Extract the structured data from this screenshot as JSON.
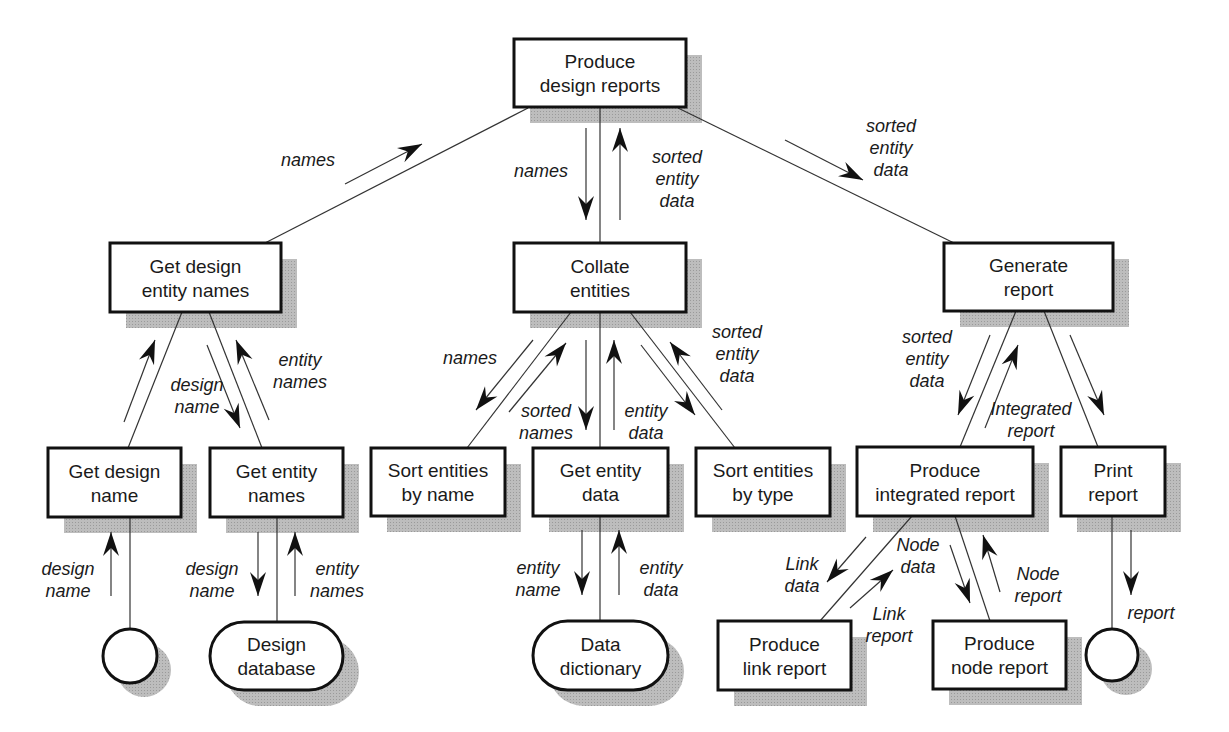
{
  "diagram": {
    "colors": {
      "box_border": "#111111",
      "shadow": "#b4b4b4",
      "line": "#333333",
      "background": "#ffffff"
    },
    "shadow_offset": 16,
    "nodes": [
      {
        "id": "produce-design-reports",
        "shape": "rect",
        "x": 514,
        "y": 39,
        "w": 172,
        "h": 68,
        "lines": [
          "Produce",
          "design reports"
        ]
      },
      {
        "id": "get-design-entity-names",
        "shape": "rect",
        "x": 110,
        "y": 243,
        "w": 171,
        "h": 69,
        "lines": [
          "Get design",
          "entity names"
        ]
      },
      {
        "id": "collate-entities",
        "shape": "rect",
        "x": 514,
        "y": 243,
        "w": 172,
        "h": 69,
        "lines": [
          "Collate",
          "entities"
        ]
      },
      {
        "id": "generate-report",
        "shape": "rect",
        "x": 944,
        "y": 243,
        "w": 169,
        "h": 68,
        "lines": [
          "Generate",
          "report"
        ]
      },
      {
        "id": "get-design-name",
        "shape": "rect",
        "x": 48,
        "y": 448,
        "w": 133,
        "h": 69,
        "lines": [
          "Get design",
          "name"
        ]
      },
      {
        "id": "get-entity-names",
        "shape": "rect",
        "x": 210,
        "y": 448,
        "w": 133,
        "h": 69,
        "lines": [
          "Get entity",
          "names"
        ]
      },
      {
        "id": "sort-entities-by-name",
        "shape": "rect",
        "x": 371,
        "y": 448,
        "w": 134,
        "h": 68,
        "lines": [
          "Sort entities",
          "by name"
        ]
      },
      {
        "id": "get-entity-data",
        "shape": "rect",
        "x": 533,
        "y": 448,
        "w": 135,
        "h": 68,
        "lines": [
          "Get entity",
          "data"
        ]
      },
      {
        "id": "sort-entities-by-type",
        "shape": "rect",
        "x": 696,
        "y": 448,
        "w": 134,
        "h": 68,
        "lines": [
          "Sort entities",
          "by type"
        ]
      },
      {
        "id": "produce-integrated-report",
        "shape": "rect",
        "x": 857,
        "y": 447,
        "w": 176,
        "h": 69,
        "lines": [
          "Produce",
          "integrated report"
        ]
      },
      {
        "id": "print-report",
        "shape": "rect",
        "x": 1061,
        "y": 447,
        "w": 104,
        "h": 69,
        "lines": [
          "Print",
          "report"
        ]
      },
      {
        "id": "produce-link-report",
        "shape": "rect",
        "x": 718,
        "y": 621,
        "w": 133,
        "h": 69,
        "lines": [
          "Produce",
          "link report"
        ]
      },
      {
        "id": "produce-node-report",
        "shape": "rect",
        "x": 933,
        "y": 621,
        "w": 133,
        "h": 68,
        "lines": [
          "Produce",
          "node report"
        ]
      },
      {
        "id": "design-database",
        "shape": "rounded",
        "x": 210,
        "y": 622,
        "w": 133,
        "h": 68,
        "lines": [
          "Design",
          "database"
        ]
      },
      {
        "id": "data-dictionary",
        "shape": "rounded",
        "x": 533,
        "y": 621,
        "w": 135,
        "h": 69,
        "lines": [
          "Data",
          "dictionary"
        ]
      },
      {
        "id": "terminator-left",
        "shape": "circle",
        "cx": 130,
        "cy": 656,
        "r": 27,
        "lines": []
      },
      {
        "id": "terminator-right",
        "shape": "circle",
        "cx": 1112,
        "cy": 655,
        "r": 26,
        "lines": []
      }
    ],
    "connectors": [
      {
        "from": "produce-design-reports",
        "to": "get-design-entity-names",
        "x1": 528,
        "y1": 108,
        "x2": 265,
        "y2": 243
      },
      {
        "from": "produce-design-reports",
        "to": "collate-entities",
        "x1": 600,
        "y1": 108,
        "x2": 600,
        "y2": 243
      },
      {
        "from": "produce-design-reports",
        "to": "generate-report",
        "x1": 678,
        "y1": 108,
        "x2": 954,
        "y2": 243
      },
      {
        "from": "get-design-entity-names",
        "to": "get-design-name",
        "x1": 182,
        "y1": 312,
        "x2": 128,
        "y2": 448
      },
      {
        "from": "get-design-entity-names",
        "to": "get-entity-names",
        "x1": 209,
        "y1": 312,
        "x2": 262,
        "y2": 448
      },
      {
        "from": "get-design-name",
        "to": "terminator-left",
        "x1": 130,
        "y1": 517,
        "x2": 130,
        "y2": 629
      },
      {
        "from": "get-entity-names",
        "to": "design-database",
        "x1": 277,
        "y1": 517,
        "x2": 277,
        "y2": 622
      },
      {
        "from": "collate-entities",
        "to": "sort-entities-by-name",
        "x1": 571,
        "y1": 312,
        "x2": 467,
        "y2": 448
      },
      {
        "from": "collate-entities",
        "to": "get-entity-data",
        "x1": 600,
        "y1": 312,
        "x2": 600,
        "y2": 448
      },
      {
        "from": "collate-entities",
        "to": "sort-entities-by-type",
        "x1": 630,
        "y1": 312,
        "x2": 735,
        "y2": 448
      },
      {
        "from": "get-entity-data",
        "to": "data-dictionary",
        "x1": 600,
        "y1": 516,
        "x2": 600,
        "y2": 621
      },
      {
        "from": "generate-report",
        "to": "produce-integrated-report",
        "x1": 1016,
        "y1": 311,
        "x2": 960,
        "y2": 447
      },
      {
        "from": "generate-report",
        "to": "print-report",
        "x1": 1044,
        "y1": 311,
        "x2": 1098,
        "y2": 447
      },
      {
        "from": "produce-integrated-report",
        "to": "produce-link-report",
        "x1": 912,
        "y1": 516,
        "x2": 820,
        "y2": 621
      },
      {
        "from": "produce-integrated-report",
        "to": "produce-node-report",
        "x1": 955,
        "y1": 516,
        "x2": 990,
        "y2": 621
      },
      {
        "from": "print-report",
        "to": "terminator-right",
        "x1": 1112,
        "y1": 516,
        "x2": 1112,
        "y2": 629
      }
    ],
    "flows": [
      {
        "x1": 345,
        "y1": 184,
        "x2": 422,
        "y2": 144,
        "label": [
          "names"
        ],
        "lx": 335,
        "ly": 166,
        "anchor": "end"
      },
      {
        "x1": 586,
        "y1": 128,
        "x2": 586,
        "y2": 220,
        "label": [
          "names"
        ],
        "lx": 568,
        "ly": 177,
        "anchor": "end"
      },
      {
        "x1": 620,
        "y1": 220,
        "x2": 620,
        "y2": 128,
        "label": [
          "sorted",
          "entity",
          "data"
        ],
        "lx": 677,
        "ly": 163,
        "anchor": "middle"
      },
      {
        "x1": 785,
        "y1": 140,
        "x2": 863,
        "y2": 180,
        "label": [
          "sorted",
          "entity",
          "data"
        ],
        "lx": 891,
        "ly": 132,
        "anchor": "middle"
      },
      {
        "x1": 124,
        "y1": 422,
        "x2": 155,
        "y2": 340,
        "label": [],
        "lx": 0,
        "ly": 0,
        "anchor": "middle"
      },
      {
        "x1": 207,
        "y1": 345,
        "x2": 240,
        "y2": 428,
        "label": [
          "design",
          "name"
        ],
        "lx": 197,
        "ly": 391,
        "anchor": "middle"
      },
      {
        "x1": 269,
        "y1": 420,
        "x2": 236,
        "y2": 340,
        "label": [
          "entity",
          "names"
        ],
        "lx": 300,
        "ly": 366,
        "anchor": "middle"
      },
      {
        "x1": 111,
        "y1": 596,
        "x2": 111,
        "y2": 532,
        "label": [
          "design",
          "name"
        ],
        "lx": 68,
        "ly": 575,
        "anchor": "middle"
      },
      {
        "x1": 258,
        "y1": 532,
        "x2": 258,
        "y2": 596,
        "label": [
          "design",
          "name"
        ],
        "lx": 212,
        "ly": 575,
        "anchor": "middle"
      },
      {
        "x1": 295,
        "y1": 596,
        "x2": 295,
        "y2": 532,
        "label": [
          "entity",
          "names"
        ],
        "lx": 337,
        "ly": 575,
        "anchor": "middle"
      },
      {
        "x1": 533,
        "y1": 340,
        "x2": 476,
        "y2": 410,
        "label": [
          "names"
        ],
        "lx": 470,
        "ly": 364,
        "anchor": "middle"
      },
      {
        "x1": 509,
        "y1": 412,
        "x2": 566,
        "y2": 343,
        "label": [
          "sorted",
          "names"
        ],
        "lx": 546,
        "ly": 417,
        "anchor": "middle"
      },
      {
        "x1": 586,
        "y1": 340,
        "x2": 586,
        "y2": 430,
        "label": [],
        "lx": 0,
        "ly": 0,
        "anchor": "middle"
      },
      {
        "x1": 614,
        "y1": 430,
        "x2": 614,
        "y2": 340,
        "label": [
          "entity",
          "data"
        ],
        "lx": 646,
        "ly": 417,
        "anchor": "middle"
      },
      {
        "x1": 641,
        "y1": 345,
        "x2": 695,
        "y2": 415,
        "label": [],
        "lx": 0,
        "ly": 0,
        "anchor": "middle"
      },
      {
        "x1": 722,
        "y1": 410,
        "x2": 670,
        "y2": 342,
        "label": [
          "sorted",
          "entity",
          "data"
        ],
        "lx": 737,
        "ly": 338,
        "anchor": "middle"
      },
      {
        "x1": 582,
        "y1": 530,
        "x2": 582,
        "y2": 595,
        "label": [
          "entity",
          "name"
        ],
        "lx": 538,
        "ly": 574,
        "anchor": "middle"
      },
      {
        "x1": 619,
        "y1": 595,
        "x2": 619,
        "y2": 530,
        "label": [
          "entity",
          "data"
        ],
        "lx": 661,
        "ly": 574,
        "anchor": "middle"
      },
      {
        "x1": 990,
        "y1": 335,
        "x2": 958,
        "y2": 415,
        "label": [
          "sorted",
          "entity",
          "data"
        ],
        "lx": 927,
        "ly": 343,
        "anchor": "middle"
      },
      {
        "x1": 985,
        "y1": 428,
        "x2": 1018,
        "y2": 345,
        "label": [
          "Integrated",
          "report"
        ],
        "lx": 1031,
        "ly": 415,
        "anchor": "middle"
      },
      {
        "x1": 1070,
        "y1": 335,
        "x2": 1104,
        "y2": 415,
        "label": [],
        "lx": 0,
        "ly": 0,
        "anchor": "middle"
      },
      {
        "x1": 866,
        "y1": 537,
        "x2": 827,
        "y2": 582,
        "label": [
          "Link",
          "data"
        ],
        "lx": 802,
        "ly": 570,
        "anchor": "middle"
      },
      {
        "x1": 850,
        "y1": 608,
        "x2": 893,
        "y2": 570,
        "label": [
          "Link",
          "report"
        ],
        "lx": 889,
        "ly": 620,
        "anchor": "middle"
      },
      {
        "x1": 950,
        "y1": 545,
        "x2": 970,
        "y2": 603,
        "label": [
          "Node",
          "data"
        ],
        "lx": 918,
        "ly": 551,
        "anchor": "middle"
      },
      {
        "x1": 1000,
        "y1": 592,
        "x2": 983,
        "y2": 535,
        "label": [
          "Node",
          "report"
        ],
        "lx": 1038,
        "ly": 580,
        "anchor": "middle"
      },
      {
        "x1": 1131,
        "y1": 530,
        "x2": 1131,
        "y2": 595,
        "label": [
          "report"
        ],
        "lx": 1151,
        "ly": 619,
        "anchor": "middle"
      }
    ]
  }
}
